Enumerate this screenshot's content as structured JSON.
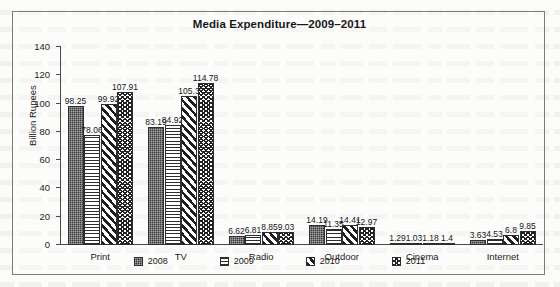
{
  "chart_data": {
    "type": "bar",
    "title": "Media Expenditure—2009–2011",
    "xlabel": "",
    "ylabel": "Billion Rupees",
    "ylim": [
      0,
      140
    ],
    "ytick_step": 20,
    "yticks": [
      "0",
      "20",
      "40",
      "60",
      "80",
      "100",
      "120",
      "140"
    ],
    "grid": false,
    "legend_position": "bottom",
    "categories": [
      "Print",
      "TV",
      "Radio",
      "Outdoor",
      "Cinema",
      "Internet"
    ],
    "series": [
      {
        "name": "2008",
        "pattern": "dark-stipple",
        "values": [
          98.25,
          83.19,
          6.62,
          14.19,
          1.29,
          3.63
        ],
        "labels": [
          "98.25",
          "83.19",
          "6.62",
          "14.19",
          "1.29",
          "3.63"
        ]
      },
      {
        "name": "2009",
        "pattern": "horizontal-lines",
        "values": [
          78.06,
          84.92,
          6.81,
          11.35,
          1.03,
          4.53
        ],
        "labels": [
          "78.06",
          "84.92",
          "6.81",
          "11.35",
          "1.03",
          "4.53"
        ]
      },
      {
        "name": "2010",
        "pattern": "diagonal-stripes",
        "values": [
          99.92,
          105.3,
          8.85,
          14.41,
          1.18,
          6.8
        ],
        "labels": [
          "99.92",
          "105.3",
          "8.85",
          "14.41",
          "1.18",
          "6.8"
        ]
      },
      {
        "name": "2011",
        "pattern": "zigzag-wave",
        "values": [
          107.91,
          114.78,
          9.03,
          12.97,
          1.4,
          9.85
        ],
        "labels": [
          "107.91",
          "114.78",
          "9.03",
          "12.97",
          "1.4",
          "9.85"
        ]
      }
    ]
  }
}
